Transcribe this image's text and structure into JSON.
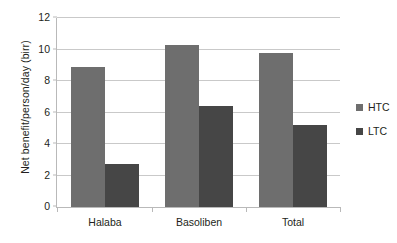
{
  "chart_data": {
    "type": "bar",
    "title": "",
    "xlabel": "",
    "ylabel": "Net benefit/person/day (birr)",
    "categories": [
      "Halaba",
      "Basoliben",
      "Total"
    ],
    "series": [
      {
        "name": "HTC",
        "color": "#6e6e6e",
        "values": [
          8.9,
          10.3,
          9.8
        ]
      },
      {
        "name": "LTC",
        "color": "#464646",
        "values": [
          2.7,
          6.4,
          5.2
        ]
      }
    ],
    "ylim": [
      0,
      12
    ],
    "yticks": [
      0,
      2,
      4,
      6,
      8,
      10,
      12
    ],
    "ytick_labels": [
      "0",
      "2",
      "4",
      "6",
      "8",
      "10",
      "12"
    ],
    "grid": true,
    "legend_position": "right"
  },
  "axis": {
    "y_title": "Net benefit/person/day (birr)"
  },
  "legend": {
    "items": [
      {
        "label": "HTC",
        "color": "#6e6e6e"
      },
      {
        "label": "LTC",
        "color": "#464646"
      }
    ]
  }
}
